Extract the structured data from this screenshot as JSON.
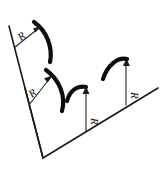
{
  "figure": {
    "background_color": "#ffffff",
    "ink_color": "#111111",
    "arc_color": "#0d0d0d",
    "leader_color": "#2b2b2b"
  },
  "labels": {
    "radius_1": "R",
    "radius_2": "R",
    "radius_3": "R",
    "radius_4": "R"
  },
  "geometry": {
    "baseline_left": {
      "name": "left-diagonal-baseline",
      "from": [
        9,
        26
      ],
      "to": [
        43,
        158
      ]
    },
    "baseline_right": {
      "name": "right-diagonal-baseline",
      "from": [
        43,
        158
      ],
      "to": [
        158,
        88
      ]
    },
    "baseline_inner": {
      "name": "inner-diagonal-baseline",
      "from": [
        25,
        88
      ],
      "to": [
        43,
        158
      ]
    },
    "arcs": [
      {
        "name": "arc-1",
        "start": [
          34,
          22
        ],
        "end": [
          50,
          62
        ],
        "bow": "right",
        "label": "R"
      },
      {
        "name": "arc-2",
        "start": [
          46,
          70
        ],
        "end": [
          62,
          111
        ],
        "bow": "right",
        "label": "R"
      },
      {
        "name": "arc-3",
        "start": [
          67,
          101
        ],
        "end": [
          86,
          87
        ],
        "bow": "up",
        "label": "R"
      },
      {
        "name": "arc-4",
        "start": [
          103,
          79
        ],
        "end": [
          127,
          59
        ],
        "bow": "up",
        "label": "R"
      }
    ],
    "leaders": [
      {
        "name": "leader-1",
        "from": [
          15,
          47
        ],
        "to": [
          41,
          27
        ]
      },
      {
        "name": "leader-2",
        "from": [
          29,
          105
        ],
        "to": [
          53,
          76
        ]
      },
      {
        "name": "leader-3",
        "from": [
          86,
          131
        ],
        "to": [
          86,
          89
        ]
      },
      {
        "name": "leader-4",
        "from": [
          126,
          105
        ],
        "to": [
          126,
          61
        ]
      }
    ]
  }
}
